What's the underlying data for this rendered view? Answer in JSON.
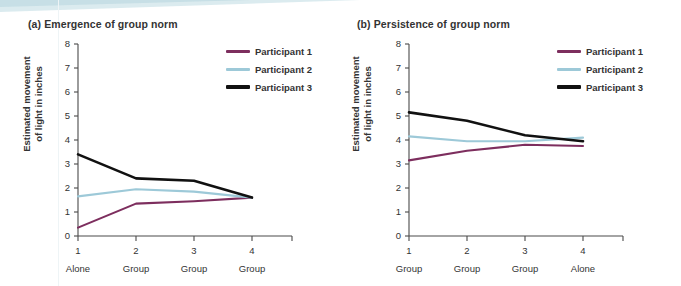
{
  "figure": {
    "series_colors": {
      "participant_1": "#7d2e5e",
      "participant_2": "#9dc9d8",
      "participant_3": "#111111"
    },
    "axis_color": "#4a4a4a",
    "text_color": "#333333",
    "decorative_band_color": "#cfe4ea"
  },
  "panel_a": {
    "title": "(a) Emergence of group norm",
    "ylabel_line1": "Estimated movement",
    "ylabel_line2": "of light in inches",
    "legend": [
      {
        "label": "Participant 1",
        "color": "#7d2e5e"
      },
      {
        "label": "Participant 2",
        "color": "#9dc9d8"
      },
      {
        "label": "Participant 3",
        "color": "#111111"
      }
    ]
  },
  "panel_b": {
    "title": "(b) Persistence of group norm",
    "ylabel_line1": "Estimated movement",
    "ylabel_line2": "of light in inches",
    "legend": [
      {
        "label": "Participant 1",
        "color": "#7d2e5e"
      },
      {
        "label": "Participant 2",
        "color": "#9dc9d8"
      },
      {
        "label": "Participant 3",
        "color": "#111111"
      }
    ]
  },
  "chart_data": [
    {
      "type": "line",
      "panel": "a",
      "title": "(a) Emergence of group norm",
      "xlabel": "",
      "ylabel": "Estimated movement of light in inches",
      "x": [
        1,
        2,
        3,
        4
      ],
      "xtick_numbers": [
        "1",
        "2",
        "3",
        "4"
      ],
      "xtick_conditions": [
        "Alone",
        "Group",
        "Group",
        "Group"
      ],
      "ylim": [
        0,
        8
      ],
      "ytick_labels": [
        "0",
        "1",
        "2",
        "3",
        "4",
        "5",
        "6",
        "7",
        "8"
      ],
      "ytick_values": [
        0,
        1,
        2,
        3,
        4,
        5,
        6,
        7,
        8
      ],
      "grid": false,
      "legend_position": "top-right",
      "series": [
        {
          "name": "Participant 1",
          "color": "#7d2e5e",
          "values": [
            0.35,
            1.35,
            1.45,
            1.6
          ]
        },
        {
          "name": "Participant 2",
          "color": "#9dc9d8",
          "values": [
            1.65,
            1.95,
            1.85,
            1.6
          ]
        },
        {
          "name": "Participant 3",
          "color": "#111111",
          "values": [
            3.4,
            2.4,
            2.3,
            1.6
          ]
        }
      ]
    },
    {
      "type": "line",
      "panel": "b",
      "title": "(b) Persistence of group norm",
      "xlabel": "",
      "ylabel": "Estimated movement of light in inches",
      "x": [
        1,
        2,
        3,
        4
      ],
      "xtick_numbers": [
        "1",
        "2",
        "3",
        "4"
      ],
      "xtick_conditions": [
        "Group",
        "Group",
        "Group",
        "Alone"
      ],
      "ylim": [
        0,
        8
      ],
      "ytick_labels": [
        "0",
        "1",
        "2",
        "3",
        "4",
        "5",
        "6",
        "7",
        "8"
      ],
      "ytick_values": [
        0,
        1,
        2,
        3,
        4,
        5,
        6,
        7,
        8
      ],
      "grid": false,
      "legend_position": "top-right",
      "series": [
        {
          "name": "Participant 1",
          "color": "#7d2e5e",
          "values": [
            3.15,
            3.55,
            3.8,
            3.75
          ]
        },
        {
          "name": "Participant 2",
          "color": "#9dc9d8",
          "values": [
            4.15,
            3.95,
            3.95,
            4.1
          ]
        },
        {
          "name": "Participant 3",
          "color": "#111111",
          "values": [
            5.15,
            4.8,
            4.2,
            3.95
          ]
        }
      ]
    }
  ]
}
